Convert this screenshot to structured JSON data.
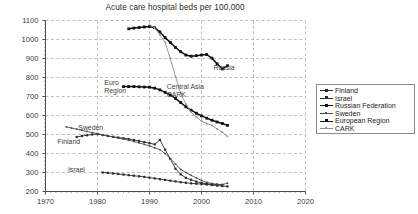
{
  "chart_data": {
    "type": "line",
    "title": "Acute care hospital beds per 100,000",
    "xlabel": "",
    "ylabel": "",
    "xlim": [
      1970,
      2020
    ],
    "ylim": [
      200,
      1100
    ],
    "xticks": [
      1970,
      1980,
      1990,
      2000,
      2010,
      2020
    ],
    "yticks": [
      200,
      300,
      400,
      500,
      600,
      700,
      800,
      900,
      1000,
      1100
    ],
    "grid": true,
    "legend_position": "right",
    "series": [
      {
        "name": "Finland",
        "color": "#2b2b2b",
        "marker": "square-small",
        "x": [
          1976,
          1977,
          1978,
          1979,
          1980,
          1981,
          1982,
          1983,
          1984,
          1985,
          1986,
          1987,
          1988,
          1989,
          1990,
          1991,
          1992,
          1993,
          1994,
          1995,
          1996,
          1997,
          1998,
          1999,
          2000,
          2001,
          2002,
          2003,
          2004
        ],
        "y": [
          487,
          492,
          496,
          500,
          502,
          497,
          492,
          488,
          484,
          480,
          476,
          471,
          466,
          460,
          454,
          448,
          472,
          420,
          372,
          320,
          290,
          272,
          262,
          252,
          245,
          240,
          238,
          236,
          235
        ]
      },
      {
        "name": "Israel",
        "color": "#2b2b2b",
        "marker": "square-small",
        "x": [
          1981,
          1982,
          1983,
          1984,
          1985,
          1986,
          1987,
          1988,
          1989,
          1990,
          1991,
          1992,
          1993,
          1994,
          1995,
          1996,
          1997,
          1998,
          1999,
          2000,
          2001,
          2002,
          2003,
          2004,
          2005
        ],
        "y": [
          300,
          298,
          295,
          292,
          289,
          286,
          283,
          280,
          277,
          273,
          269,
          265,
          261,
          257,
          253,
          249,
          246,
          243,
          241,
          239,
          237,
          234,
          231,
          229,
          227
        ]
      },
      {
        "name": "Russian Federation",
        "color": "#111111",
        "marker": "square",
        "x": [
          1986,
          1987,
          1988,
          1989,
          1990,
          1991,
          1992,
          1993,
          1994,
          1995,
          1996,
          1997,
          1998,
          1999,
          2000,
          2001,
          2002,
          2003,
          2004,
          2005
        ],
        "y": [
          1056,
          1060,
          1063,
          1066,
          1068,
          1062,
          1040,
          1010,
          985,
          958,
          936,
          918,
          912,
          915,
          918,
          921,
          902,
          872,
          845,
          862
        ]
      },
      {
        "name": "Sweden",
        "color": "#4a4a4a",
        "marker": "dot",
        "x": [
          1974,
          1975,
          1976,
          1977,
          1978,
          1979,
          1980,
          1981,
          1982,
          1983,
          1984,
          1985,
          1986,
          1987,
          1988,
          1989,
          1990,
          1991,
          1992,
          1993,
          1994,
          1995,
          1996,
          1997,
          1998,
          1999,
          2000,
          2001,
          2002,
          2003,
          2004,
          2005
        ],
        "y": [
          540,
          534,
          528,
          522,
          516,
          510,
          505,
          498,
          492,
          487,
          481,
          476,
          470,
          463,
          456,
          448,
          440,
          430,
          420,
          400,
          372,
          344,
          316,
          300,
          285,
          272,
          258,
          248,
          242,
          238,
          236,
          244
        ]
      },
      {
        "name": "European Region",
        "color": "#111111",
        "marker": "square",
        "x": [
          1985,
          1986,
          1987,
          1988,
          1989,
          1990,
          1991,
          1992,
          1993,
          1994,
          1995,
          1996,
          1997,
          1998,
          1999,
          2000,
          2001,
          2002,
          2003,
          2004,
          2005
        ],
        "y": [
          752,
          752,
          752,
          751,
          750,
          749,
          744,
          735,
          722,
          708,
          690,
          668,
          646,
          628,
          612,
          598,
          586,
          575,
          566,
          558,
          548
        ]
      },
      {
        "name": "CARK",
        "color": "#8e8e8e",
        "marker": "dot",
        "x": [
          1990,
          1991,
          1992,
          1993,
          1994,
          1995,
          1996,
          1997,
          1998,
          1999,
          2000,
          2001,
          2002,
          2003,
          2004,
          2005
        ],
        "y": [
          1078,
          1060,
          1025,
          985,
          900,
          805,
          718,
          660,
          618,
          592,
          570,
          558,
          548,
          530,
          512,
          490
        ]
      }
    ],
    "annotations": [
      {
        "text": "Euro Region",
        "x": 1984,
        "y": 765
      },
      {
        "text": "Central Asia CARK",
        "x": 1996,
        "y": 745
      },
      {
        "text": "Russia",
        "x": 2005,
        "y": 845
      },
      {
        "text": "Sweden",
        "x": 1979,
        "y": 528
      },
      {
        "text": "Finland",
        "x": 1975,
        "y": 455
      },
      {
        "text": "Israel",
        "x": 1977,
        "y": 308
      }
    ]
  },
  "legend": {
    "items": [
      {
        "label": "Finland"
      },
      {
        "label": "Israel"
      },
      {
        "label": "Russian Federation"
      },
      {
        "label": "Sweden"
      },
      {
        "label": "European Region"
      },
      {
        "label": "CARK"
      }
    ]
  }
}
